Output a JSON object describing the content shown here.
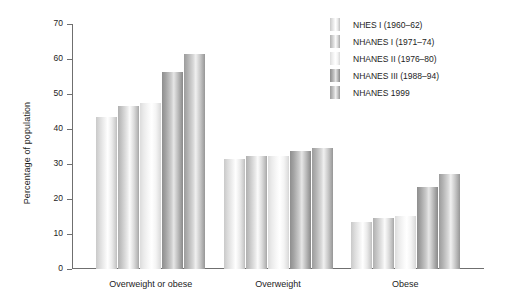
{
  "chart_data": {
    "type": "bar",
    "title": "",
    "subtitle": "",
    "xlabel": "",
    "ylabel": "Percentage of population",
    "ylim": [
      0,
      70
    ],
    "ytick_step": 10,
    "yticks": [
      0,
      10,
      20,
      30,
      40,
      50,
      60,
      70
    ],
    "ytick_labels": [
      "0",
      "10",
      "20",
      "30",
      "40",
      "50",
      "60",
      "70"
    ],
    "grid": false,
    "legend_position": "top-right",
    "categories": [
      "Overweight or obese",
      "Overweight",
      "Obese"
    ],
    "series": [
      {
        "name": "NHES I (1960–62)",
        "values": [
          43.3,
          31.5,
          13.4
        ]
      },
      {
        "name": "NHANES I (1971–74)",
        "values": [
          46.7,
          32.4,
          14.6
        ]
      },
      {
        "name": "NHANES II (1976–80)",
        "values": [
          47.5,
          32.4,
          15.1
        ]
      },
      {
        "name": "NHANES III (1988–94)",
        "values": [
          56.2,
          33.7,
          23.5
        ]
      },
      {
        "name": "NHANES 1999",
        "values": [
          61.4,
          34.5,
          27.2
        ]
      }
    ]
  },
  "legend": {
    "items": [
      {
        "label": "NHES I (1960–62)"
      },
      {
        "label": "NHANES I (1971–74)"
      },
      {
        "label": "NHANES II (1976–80)"
      },
      {
        "label": "NHANES III (1988–94)"
      },
      {
        "label": "NHANES 1999"
      }
    ]
  },
  "axis": {
    "y_title": "Percentage of population",
    "y_tick_labels": [
      "70",
      "60",
      "50",
      "40",
      "30",
      "20",
      "10",
      "0"
    ],
    "x_category_labels": [
      "Overweight or obese",
      "Overweight",
      "Obese"
    ]
  },
  "colors": {
    "axis": "#6f6f6f",
    "text": "#1d1d1d",
    "background": "#ffffff"
  }
}
